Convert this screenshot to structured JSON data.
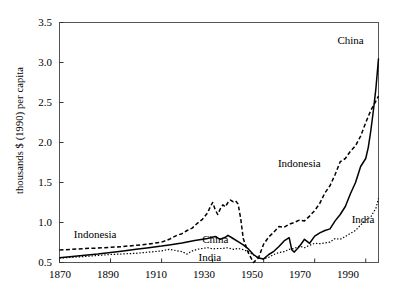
{
  "chart_data": {
    "type": "line",
    "title": "",
    "xlabel": "",
    "ylabel": "thousands $ (1990) per capita",
    "xlim": [
      1870,
      1995
    ],
    "ylim": [
      0.5,
      3.5
    ],
    "grid": false,
    "legend": "inline-annotations",
    "xticks": [
      1870,
      1890,
      1910,
      1930,
      1950,
      1970,
      1990
    ],
    "yticks": [
      "0.5",
      "1.0",
      "1.5",
      "2.0",
      "2.5",
      "3.0",
      "3.5"
    ],
    "annotations": [
      {
        "text": "China",
        "x": 1984,
        "y": 3.28
      },
      {
        "text": "Indonesia",
        "x": 1964,
        "y": 1.75
      },
      {
        "text": "India",
        "x": 1989,
        "y": 1.05
      },
      {
        "text": "Indonesia",
        "x": 1884,
        "y": 0.86
      },
      {
        "text": "China",
        "x": 1931,
        "y": 0.8
      },
      {
        "text": "India",
        "x": 1929,
        "y": 0.575
      }
    ],
    "series": [
      {
        "name": "China",
        "style": "solid",
        "color": "#000000",
        "points": [
          [
            1870,
            0.56
          ],
          [
            1875,
            0.575
          ],
          [
            1880,
            0.59
          ],
          [
            1885,
            0.605
          ],
          [
            1890,
            0.625
          ],
          [
            1895,
            0.645
          ],
          [
            1900,
            0.665
          ],
          [
            1905,
            0.685
          ],
          [
            1910,
            0.705
          ],
          [
            1913,
            0.72
          ],
          [
            1918,
            0.745
          ],
          [
            1923,
            0.775
          ],
          [
            1928,
            0.8
          ],
          [
            1931,
            0.825
          ],
          [
            1933,
            0.79
          ],
          [
            1935,
            0.815
          ],
          [
            1936,
            0.84
          ],
          [
            1938,
            0.8
          ],
          [
            1940,
            0.76
          ],
          [
            1942,
            0.72
          ],
          [
            1944,
            0.67
          ],
          [
            1946,
            0.6
          ],
          [
            1948,
            0.555
          ],
          [
            1950,
            0.545
          ],
          [
            1952,
            0.6
          ],
          [
            1954,
            0.64
          ],
          [
            1956,
            0.7
          ],
          [
            1958,
            0.77
          ],
          [
            1960,
            0.81
          ],
          [
            1961,
            0.66
          ],
          [
            1962,
            0.63
          ],
          [
            1964,
            0.7
          ],
          [
            1966,
            0.79
          ],
          [
            1968,
            0.74
          ],
          [
            1970,
            0.83
          ],
          [
            1972,
            0.87
          ],
          [
            1974,
            0.9
          ],
          [
            1976,
            0.92
          ],
          [
            1978,
            1.02
          ],
          [
            1980,
            1.1
          ],
          [
            1982,
            1.2
          ],
          [
            1984,
            1.36
          ],
          [
            1986,
            1.5
          ],
          [
            1988,
            1.7
          ],
          [
            1990,
            1.8
          ],
          [
            1991,
            1.94
          ],
          [
            1992,
            2.15
          ],
          [
            1993,
            2.4
          ],
          [
            1994,
            2.68
          ],
          [
            1995,
            3.05
          ]
        ]
      },
      {
        "name": "Indonesia",
        "style": "dashed",
        "color": "#000000",
        "points": [
          [
            1870,
            0.655
          ],
          [
            1875,
            0.665
          ],
          [
            1880,
            0.675
          ],
          [
            1885,
            0.68
          ],
          [
            1890,
            0.69
          ],
          [
            1895,
            0.7
          ],
          [
            1900,
            0.715
          ],
          [
            1905,
            0.73
          ],
          [
            1910,
            0.755
          ],
          [
            1913,
            0.79
          ],
          [
            1916,
            0.84
          ],
          [
            1918,
            0.86
          ],
          [
            1920,
            0.9
          ],
          [
            1922,
            0.93
          ],
          [
            1924,
            0.99
          ],
          [
            1926,
            1.04
          ],
          [
            1928,
            1.12
          ],
          [
            1929,
            1.19
          ],
          [
            1930,
            1.25
          ],
          [
            1931,
            1.16
          ],
          [
            1932,
            1.1
          ],
          [
            1933,
            1.17
          ],
          [
            1934,
            1.22
          ],
          [
            1935,
            1.195
          ],
          [
            1936,
            1.25
          ],
          [
            1937,
            1.28
          ],
          [
            1938,
            1.26
          ],
          [
            1939,
            1.27
          ],
          [
            1940,
            1.23
          ],
          [
            1941,
            1.05
          ],
          [
            1942,
            0.8
          ],
          [
            1944,
            0.62
          ],
          [
            1946,
            0.5
          ],
          [
            1948,
            0.56
          ],
          [
            1950,
            0.73
          ],
          [
            1952,
            0.82
          ],
          [
            1954,
            0.88
          ],
          [
            1956,
            0.95
          ],
          [
            1958,
            0.94
          ],
          [
            1960,
            0.98
          ],
          [
            1962,
            1.0
          ],
          [
            1964,
            1.03
          ],
          [
            1966,
            1.02
          ],
          [
            1968,
            1.08
          ],
          [
            1970,
            1.15
          ],
          [
            1972,
            1.24
          ],
          [
            1974,
            1.37
          ],
          [
            1976,
            1.46
          ],
          [
            1978,
            1.6
          ],
          [
            1980,
            1.76
          ],
          [
            1982,
            1.8
          ],
          [
            1984,
            1.89
          ],
          [
            1986,
            1.96
          ],
          [
            1988,
            2.08
          ],
          [
            1990,
            2.25
          ],
          [
            1992,
            2.4
          ],
          [
            1994,
            2.52
          ],
          [
            1995,
            2.58
          ]
        ]
      },
      {
        "name": "India",
        "style": "dotted",
        "color": "#000000",
        "points": [
          [
            1870,
            0.555
          ],
          [
            1880,
            0.575
          ],
          [
            1890,
            0.6
          ],
          [
            1900,
            0.615
          ],
          [
            1910,
            0.645
          ],
          [
            1913,
            0.665
          ],
          [
            1918,
            0.635
          ],
          [
            1920,
            0.605
          ],
          [
            1922,
            0.645
          ],
          [
            1924,
            0.665
          ],
          [
            1926,
            0.675
          ],
          [
            1928,
            0.685
          ],
          [
            1930,
            0.67
          ],
          [
            1932,
            0.675
          ],
          [
            1934,
            0.675
          ],
          [
            1936,
            0.685
          ],
          [
            1938,
            0.665
          ],
          [
            1940,
            0.675
          ],
          [
            1942,
            0.66
          ],
          [
            1944,
            0.635
          ],
          [
            1946,
            0.595
          ],
          [
            1948,
            0.555
          ],
          [
            1950,
            0.545
          ],
          [
            1952,
            0.565
          ],
          [
            1954,
            0.6
          ],
          [
            1956,
            0.625
          ],
          [
            1958,
            0.635
          ],
          [
            1960,
            0.665
          ],
          [
            1962,
            0.675
          ],
          [
            1964,
            0.705
          ],
          [
            1966,
            0.685
          ],
          [
            1968,
            0.715
          ],
          [
            1970,
            0.74
          ],
          [
            1972,
            0.735
          ],
          [
            1974,
            0.745
          ],
          [
            1976,
            0.755
          ],
          [
            1978,
            0.8
          ],
          [
            1980,
            0.79
          ],
          [
            1982,
            0.825
          ],
          [
            1984,
            0.865
          ],
          [
            1986,
            0.9
          ],
          [
            1988,
            0.97
          ],
          [
            1990,
            1.03
          ],
          [
            1992,
            1.07
          ],
          [
            1994,
            1.18
          ],
          [
            1995,
            1.3
          ]
        ]
      }
    ]
  }
}
